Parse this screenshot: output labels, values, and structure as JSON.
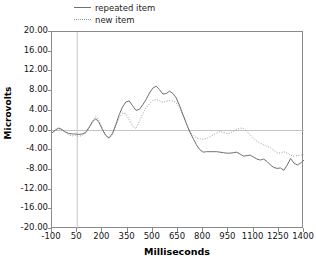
{
  "chart_data": {
    "type": "line",
    "title": "",
    "xlabel": "Milliseconds",
    "ylabel": "Microvolts",
    "xlim": [
      -100,
      1400
    ],
    "ylim": [
      -20.0,
      20.0
    ],
    "xticks": [
      -100,
      50,
      200,
      350,
      500,
      650,
      800,
      950,
      1100,
      1250,
      1400
    ],
    "xtick_labels": [
      "-100",
      "50",
      "200",
      "350",
      "500",
      "650",
      "800",
      "950",
      "1100",
      "1250",
      "1400"
    ],
    "yticks": [
      20,
      16,
      12,
      8,
      4,
      0,
      -4,
      -8,
      -12,
      -16,
      -20
    ],
    "ytick_labels": [
      "20.00",
      "16.00",
      "12.00",
      "8.00",
      "4.00",
      "0.00",
      "-4.00",
      "-8.00",
      "-12.00",
      "-16.00",
      "-20.00"
    ],
    "grid": false,
    "zero_line": true,
    "stimulus_onset_ms": 50,
    "legend_position": "above-plot-left",
    "series": [
      {
        "name": "repeated item",
        "style": "solid",
        "color": "#707070",
        "x": [
          -100,
          -80,
          -60,
          -40,
          -20,
          0,
          20,
          40,
          60,
          80,
          100,
          120,
          140,
          160,
          180,
          200,
          220,
          240,
          260,
          280,
          300,
          320,
          340,
          360,
          380,
          400,
          420,
          440,
          460,
          480,
          500,
          520,
          540,
          560,
          580,
          600,
          620,
          640,
          660,
          680,
          700,
          720,
          740,
          760,
          780,
          800,
          820,
          840,
          860,
          880,
          900,
          920,
          940,
          960,
          980,
          1000,
          1020,
          1040,
          1060,
          1080,
          1100,
          1120,
          1140,
          1160,
          1180,
          1200,
          1220,
          1240,
          1260,
          1280,
          1300,
          1320,
          1340,
          1360,
          1380,
          1400
        ],
        "y": [
          -0.5,
          0.1,
          0.5,
          0.2,
          -0.3,
          -0.6,
          -0.7,
          -0.7,
          -0.8,
          -0.7,
          -0.4,
          0.6,
          1.7,
          2.4,
          1.6,
          0.2,
          -1.0,
          -1.5,
          -0.6,
          1.2,
          3.2,
          4.8,
          5.8,
          6.0,
          5.0,
          4.1,
          4.3,
          5.2,
          6.3,
          7.6,
          8.6,
          9.0,
          8.3,
          7.4,
          7.5,
          8.0,
          7.5,
          6.6,
          5.0,
          3.2,
          1.4,
          -0.3,
          -1.6,
          -2.9,
          -3.9,
          -4.4,
          -4.3,
          -4.3,
          -4.3,
          -4.3,
          -4.4,
          -4.5,
          -4.6,
          -4.6,
          -4.5,
          -4.4,
          -4.8,
          -5.2,
          -5.1,
          -5.0,
          -5.4,
          -5.8,
          -6.0,
          -5.8,
          -6.3,
          -7.0,
          -7.5,
          -7.7,
          -7.6,
          -8.1,
          -7.0,
          -5.7,
          -6.6,
          -7.0,
          -6.6,
          -6.0
        ]
      },
      {
        "name": "new item",
        "style": "dotted",
        "color": "#9a9a9a",
        "x": [
          -100,
          -80,
          -60,
          -40,
          -20,
          0,
          20,
          40,
          60,
          80,
          100,
          120,
          140,
          160,
          180,
          200,
          220,
          240,
          260,
          280,
          300,
          320,
          340,
          360,
          380,
          400,
          420,
          440,
          460,
          480,
          500,
          520,
          540,
          560,
          580,
          600,
          620,
          640,
          660,
          680,
          700,
          720,
          740,
          760,
          780,
          800,
          820,
          840,
          860,
          880,
          900,
          920,
          940,
          960,
          980,
          1000,
          1020,
          1040,
          1060,
          1080,
          1100,
          1120,
          1140,
          1160,
          1180,
          1200,
          1220,
          1240,
          1260,
          1280,
          1300,
          1320,
          1340,
          1360,
          1380,
          1400
        ],
        "y": [
          -0.5,
          0.0,
          0.3,
          0.1,
          -0.4,
          -0.9,
          -1.1,
          -1.0,
          -1.2,
          -1.0,
          -0.6,
          0.5,
          1.9,
          2.9,
          2.0,
          0.4,
          -1.0,
          -1.6,
          -0.8,
          0.9,
          2.6,
          3.5,
          3.4,
          2.2,
          0.9,
          0.4,
          1.8,
          3.4,
          4.6,
          5.4,
          6.1,
          6.3,
          6.0,
          5.7,
          5.9,
          6.1,
          6.0,
          5.6,
          4.6,
          3.0,
          1.4,
          -0.1,
          -1.0,
          -1.5,
          -1.7,
          -1.8,
          -1.6,
          -1.3,
          -0.9,
          -0.5,
          -0.2,
          -0.4,
          -0.6,
          -0.5,
          -0.2,
          0.2,
          0.5,
          0.4,
          -0.2,
          -0.9,
          -1.6,
          -2.2,
          -2.6,
          -2.9,
          -3.2,
          -3.5,
          -4.0,
          -4.5,
          -4.6,
          -4.3,
          -4.6,
          -5.0,
          -5.2,
          -5.1,
          -5.0,
          -4.9
        ]
      }
    ]
  },
  "legend": {
    "items": [
      {
        "label": "repeated item",
        "style": "solid"
      },
      {
        "label": "new item",
        "style": "dotted"
      }
    ]
  },
  "axes": {
    "x_title": "Milliseconds",
    "y_title": "Microvolts"
  }
}
